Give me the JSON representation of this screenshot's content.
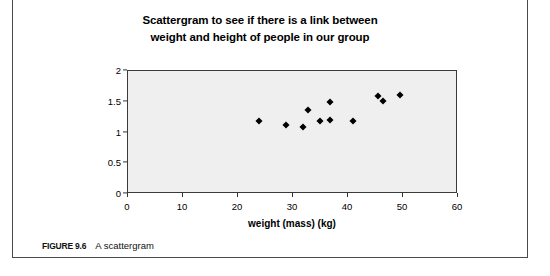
{
  "figure": {
    "caption_label": "FIGURE 9.6",
    "caption_text": "A scattergram"
  },
  "chart_data": {
    "type": "scatter",
    "title": "Scattergram to see if there is a link between weight and height of people in our group",
    "title_line1": "Scattergram to see if there is a link between",
    "title_line2": "weight and height of people in our group",
    "xlabel": "weight (mass) (kg)",
    "ylabel": "height (m)",
    "xlim": [
      0,
      60
    ],
    "ylim": [
      0,
      2
    ],
    "xticks": [
      "0",
      "10",
      "20",
      "30",
      "40",
      "50",
      "60"
    ],
    "xtick_values": [
      0,
      10,
      20,
      30,
      40,
      50,
      60
    ],
    "yticks": [
      "0",
      "0.5",
      "1",
      "1.5",
      "2"
    ],
    "ytick_values": [
      0,
      0.5,
      1,
      1.5,
      2
    ],
    "grid": false,
    "legend": false,
    "marker": "diamond",
    "marker_color": "#000000",
    "plot_background": "#efefef",
    "points": [
      {
        "x": 24.0,
        "y": 1.17
      },
      {
        "x": 28.9,
        "y": 1.11
      },
      {
        "x": 32.0,
        "y": 1.07
      },
      {
        "x": 32.9,
        "y": 1.35
      },
      {
        "x": 35.0,
        "y": 1.17
      },
      {
        "x": 36.9,
        "y": 1.48
      },
      {
        "x": 36.9,
        "y": 1.19
      },
      {
        "x": 41.0,
        "y": 1.17
      },
      {
        "x": 45.6,
        "y": 1.58
      },
      {
        "x": 46.5,
        "y": 1.5
      },
      {
        "x": 49.6,
        "y": 1.59
      }
    ]
  }
}
